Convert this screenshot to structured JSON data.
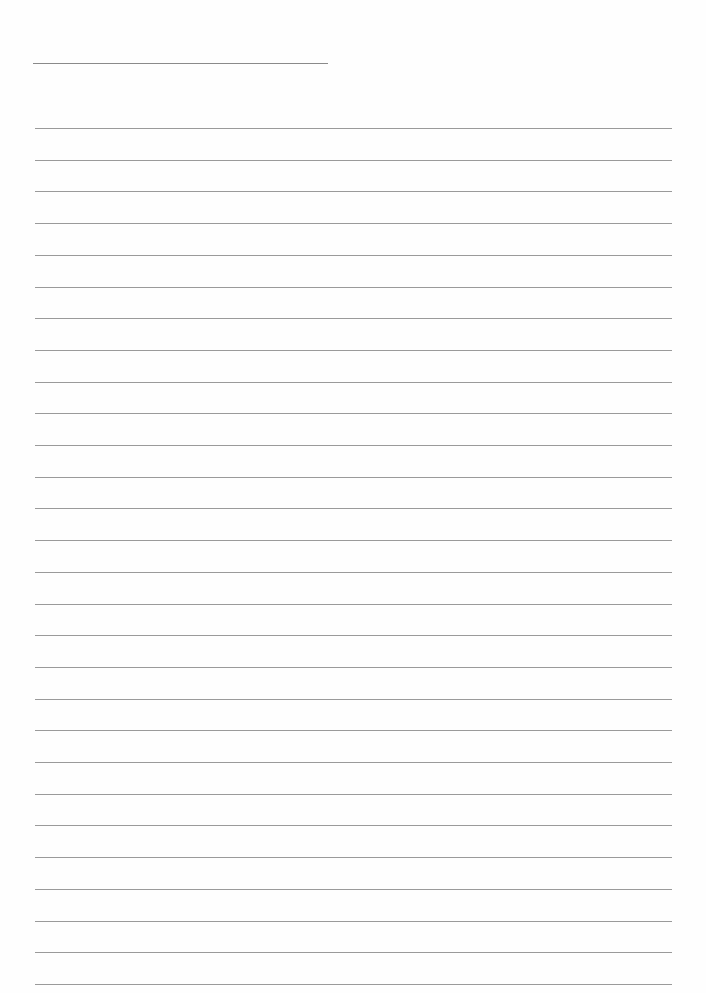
{
  "page": {
    "type": "blank-lined-paper",
    "background": "#fefefe",
    "line_color": "#9a9a9a",
    "header_line": {
      "top": 63,
      "left": 33,
      "width": 295
    },
    "ruled_lines": {
      "count": 28,
      "first_top": 128,
      "spacing": 31.7,
      "left": 35,
      "width": 637
    }
  }
}
